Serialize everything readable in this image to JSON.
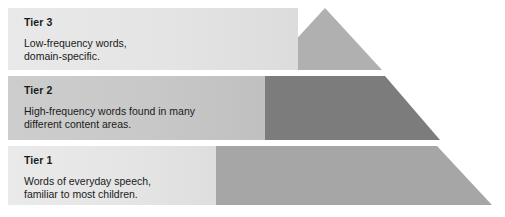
{
  "figure": {
    "name": "three-tier-vocabulary-pyramid",
    "shape": "pyramid",
    "background_color": "#ffffff"
  },
  "tiers": [
    {
      "id": "tier-3",
      "title": "Tier 3",
      "description_line_1": "Low-frequency words,",
      "description_line_2": "domain-specific.",
      "band_color": "#e6e6e6",
      "pyramid_color": "#b0b0b0",
      "position": "top"
    },
    {
      "id": "tier-2",
      "title": "Tier 2",
      "description_line_1": "High-frequency words found in many",
      "description_line_2": "different content areas.",
      "band_color": "#c8c8c8",
      "pyramid_color": "#7c7c7c",
      "position": "middle"
    },
    {
      "id": "tier-1",
      "title": "Tier 1",
      "description_line_1": "Words of everyday speech,",
      "description_line_2": "familiar to most children.",
      "band_color": "#e6e6e6",
      "pyramid_color": "#a6a6a6",
      "position": "bottom"
    }
  ]
}
